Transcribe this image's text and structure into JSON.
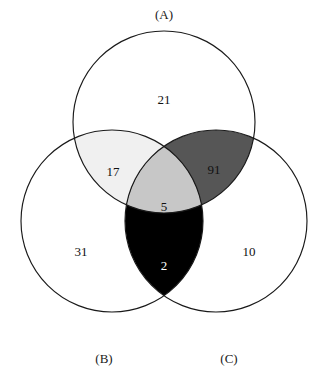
{
  "figure": {
    "type": "venn-diagram-3-set",
    "background_color": "#ffffff",
    "outline_color": "#1a1a1a"
  },
  "chart_data": {
    "type": "venn",
    "title": "",
    "sets": [
      {
        "id": "A",
        "label": "(A)",
        "label_position": "top"
      },
      {
        "id": "B",
        "label": "(B)",
        "label_position": "bottom-left"
      },
      {
        "id": "C",
        "label": "(C)",
        "label_position": "bottom-right"
      }
    ],
    "regions": [
      {
        "id": "A",
        "label": "A only",
        "value": "21",
        "fill": "#ffffff",
        "text_color": "#111111"
      },
      {
        "id": "B",
        "label": "B only",
        "value": "31",
        "fill": "#ffffff",
        "text_color": "#111111"
      },
      {
        "id": "C",
        "label": "C only",
        "value": "10",
        "fill": "#ffffff",
        "text_color": "#111111"
      },
      {
        "id": "AB",
        "label": "A and B",
        "value": "17",
        "fill": "#f0f0f0",
        "text_color": "#111111"
      },
      {
        "id": "AC",
        "label": "A and C",
        "value": "91",
        "fill": "#565656",
        "text_color": "#111111"
      },
      {
        "id": "BC",
        "label": "B and C",
        "value": "2",
        "fill": "#000000",
        "text_color": "#ffffff"
      },
      {
        "id": "ABC",
        "label": "A and B and C",
        "value": "5",
        "fill": "#c7c7c7",
        "text_color": "#111111"
      }
    ],
    "geometry": {
      "circle_a": {
        "cx": 164,
        "cy": 122,
        "r": 91
      },
      "circle_b": {
        "cx": 112,
        "cy": 221,
        "r": 91
      },
      "circle_c": {
        "cx": 216,
        "cy": 221,
        "r": 91
      }
    },
    "label_positions": {
      "set_a": {
        "x": 164,
        "y": 16
      },
      "set_b": {
        "x": 104,
        "y": 360
      },
      "set_c": {
        "x": 229,
        "y": 360
      },
      "count_a": {
        "x": 164,
        "y": 101
      },
      "count_b": {
        "x": 81,
        "y": 253
      },
      "count_c": {
        "x": 249,
        "y": 253
      },
      "count_ab": {
        "x": 113,
        "y": 173
      },
      "count_ac": {
        "x": 214,
        "y": 171
      },
      "count_bc": {
        "x": 164,
        "y": 267
      },
      "count_abc": {
        "x": 164,
        "y": 208
      }
    }
  }
}
